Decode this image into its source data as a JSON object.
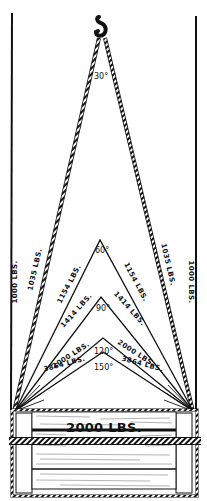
{
  "diagram": {
    "colors": {
      "ink": "#111111",
      "paper": "#ffffff",
      "wood_grain": "#555555"
    },
    "load": {
      "label": "2000 LBS.",
      "weight_lbs": 2000
    },
    "vertical_legs": {
      "label_left": "1000 LBS.",
      "label_right": "1000 LBS.",
      "angle_deg": 0,
      "leg_load_lbs": 1000
    },
    "slings": [
      {
        "angle_label": "30°",
        "angle_deg": 30,
        "leg_label_left": "1035 LBS.",
        "leg_label_right": "1035 LBS.",
        "leg_load_lbs": 1035,
        "style": "rope"
      },
      {
        "angle_label": "60°",
        "angle_deg": 60,
        "leg_label_left": "1154 LBS.",
        "leg_label_right": "1154 LBS.",
        "leg_load_lbs": 1154,
        "style": "line"
      },
      {
        "angle_label": "90°",
        "angle_deg": 90,
        "leg_label_left": "1414 LBS.",
        "leg_label_right": "1414 LBS.",
        "leg_load_lbs": 1414,
        "style": "line"
      },
      {
        "angle_label": "120°",
        "angle_deg": 120,
        "leg_label_left": "2000 LBS.",
        "leg_label_right": "2000 LBS.",
        "leg_load_lbs": 2000,
        "style": "line"
      },
      {
        "angle_label": "150°",
        "angle_deg": 150,
        "leg_label_left": "3864 LBS.",
        "leg_label_right": "3864 LBS.",
        "leg_load_lbs": 3864,
        "style": "line"
      }
    ],
    "hook": {
      "icon": "crane-hook-icon"
    }
  }
}
